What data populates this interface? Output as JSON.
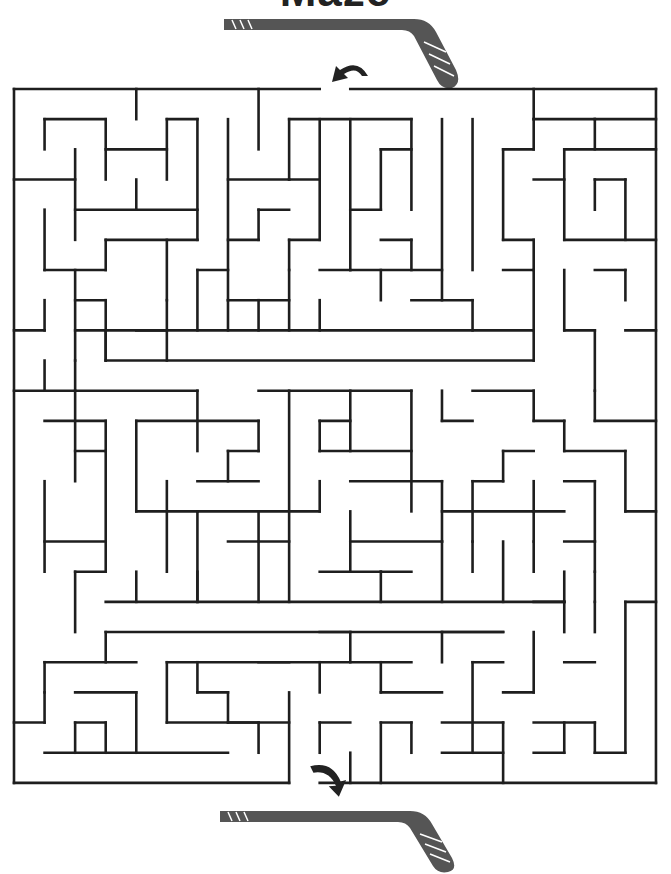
{
  "title": "Maze",
  "colors": {
    "wall": "#1e1e1e",
    "stick": "#555555",
    "arrow": "#222222",
    "background": "#ffffff"
  },
  "maze": {
    "origin": [
      14,
      89
    ],
    "cell": [
      30.57,
      30.17
    ],
    "cols": 21,
    "rows": 23,
    "entrance": {
      "label": "start-arrow",
      "col": 10.5,
      "side": "top"
    },
    "exit": {
      "label": "finish-arrow",
      "col": 10.5,
      "side": "bottom"
    },
    "walls": [
      [
        0,
        0,
        10,
        0
      ],
      [
        11,
        0,
        21,
        0
      ],
      [
        0,
        0,
        0,
        23
      ],
      [
        21,
        0,
        21,
        23
      ],
      [
        0,
        23,
        9,
        23
      ],
      [
        10,
        23,
        21,
        23
      ],
      [
        4,
        0,
        4,
        1
      ],
      [
        8,
        0,
        8,
        2
      ],
      [
        17,
        0,
        17,
        1
      ],
      [
        1,
        1,
        3,
        1
      ],
      [
        1,
        1,
        1,
        2
      ],
      [
        3,
        1,
        3,
        3
      ],
      [
        3,
        2,
        5,
        2
      ],
      [
        5,
        1,
        5,
        3
      ],
      [
        5,
        1,
        6,
        1
      ],
      [
        6,
        1,
        6,
        5
      ],
      [
        7,
        1,
        7,
        7
      ],
      [
        9,
        1,
        13,
        1
      ],
      [
        9,
        1,
        9,
        3
      ],
      [
        10,
        1,
        10,
        5
      ],
      [
        11,
        1,
        11,
        6
      ],
      [
        17,
        1,
        19,
        1
      ],
      [
        19,
        1,
        21,
        1
      ],
      [
        19,
        1,
        19,
        2
      ],
      [
        0,
        3,
        2,
        3
      ],
      [
        2,
        2,
        2,
        5
      ],
      [
        2,
        4,
        6,
        4
      ],
      [
        4,
        3,
        4,
        4
      ],
      [
        7,
        3,
        9,
        3
      ],
      [
        9,
        3,
        10,
        3
      ],
      [
        13,
        1,
        13,
        4
      ],
      [
        16,
        2,
        17,
        2
      ],
      [
        17,
        2,
        17,
        1
      ],
      [
        18,
        2,
        18,
        5
      ],
      [
        18,
        2,
        21,
        2
      ],
      [
        12,
        2,
        13,
        2
      ],
      [
        12,
        2,
        12,
        4
      ],
      [
        16,
        2,
        16,
        5
      ],
      [
        14,
        1,
        14,
        7
      ],
      [
        15,
        1,
        15,
        6
      ],
      [
        1,
        4,
        1,
        6
      ],
      [
        1,
        6,
        3,
        6
      ],
      [
        3,
        5,
        3,
        6
      ],
      [
        3,
        5,
        6,
        5
      ],
      [
        5,
        5,
        5,
        7
      ],
      [
        6,
        6,
        7,
        6
      ],
      [
        8,
        4,
        9,
        4
      ],
      [
        8,
        4,
        8,
        5
      ],
      [
        7,
        5,
        8,
        5
      ],
      [
        9,
        5,
        9,
        6
      ],
      [
        9,
        5,
        10,
        5
      ],
      [
        11,
        4,
        12,
        4
      ],
      [
        12,
        5,
        13,
        5
      ],
      [
        13,
        5,
        13,
        6
      ],
      [
        10,
        6,
        11,
        6
      ],
      [
        17,
        3,
        18,
        3
      ],
      [
        16,
        5,
        17,
        5
      ],
      [
        17,
        5,
        17,
        6
      ],
      [
        18,
        5,
        21,
        5
      ],
      [
        19,
        3,
        20,
        3
      ],
      [
        19,
        3,
        19,
        4
      ],
      [
        20,
        3,
        20,
        5
      ],
      [
        2,
        6,
        2,
        9
      ],
      [
        2,
        7,
        3,
        7
      ],
      [
        0,
        8,
        1,
        8
      ],
      [
        1,
        7,
        1,
        8
      ],
      [
        3,
        7,
        3,
        9
      ],
      [
        4,
        8,
        5,
        8
      ],
      [
        5,
        7,
        5,
        9
      ],
      [
        6,
        6,
        6,
        8
      ],
      [
        7,
        7,
        7,
        8
      ],
      [
        7,
        7,
        9,
        7
      ],
      [
        8,
        7,
        8,
        8
      ],
      [
        9,
        6,
        9,
        8
      ],
      [
        10,
        7,
        10,
        8
      ],
      [
        11,
        6,
        14,
        6
      ],
      [
        12,
        6,
        12,
        7
      ],
      [
        13,
        7,
        15,
        7
      ],
      [
        15,
        7,
        15,
        8
      ],
      [
        16,
        6,
        17,
        6
      ],
      [
        17,
        6,
        17,
        8
      ],
      [
        18,
        6,
        18,
        8
      ],
      [
        19,
        6,
        20,
        6
      ],
      [
        20,
        6,
        20,
        7
      ],
      [
        2,
        8,
        3,
        8
      ],
      [
        3,
        8,
        3,
        9
      ],
      [
        3,
        9,
        17,
        9
      ],
      [
        3,
        8,
        17,
        8
      ],
      [
        17,
        8,
        17,
        9
      ],
      [
        18,
        8,
        19,
        8
      ],
      [
        19,
        8,
        19,
        10
      ],
      [
        20,
        8,
        21,
        8
      ],
      [
        0,
        10,
        2,
        10
      ],
      [
        1,
        9,
        1,
        10
      ],
      [
        2,
        10,
        6,
        10
      ],
      [
        2,
        9,
        2,
        13
      ],
      [
        6,
        10,
        6,
        12
      ],
      [
        8,
        10,
        13,
        10
      ],
      [
        9,
        10,
        9,
        17
      ],
      [
        10,
        11,
        11,
        11
      ],
      [
        10,
        11,
        10,
        12
      ],
      [
        11,
        10,
        11,
        12
      ],
      [
        13,
        10,
        13,
        14
      ],
      [
        14,
        10,
        14,
        11
      ],
      [
        14,
        11,
        15,
        11
      ],
      [
        15,
        10,
        17,
        10
      ],
      [
        17,
        10,
        17,
        11
      ],
      [
        16,
        12,
        17,
        12
      ],
      [
        17,
        11,
        18,
        11
      ],
      [
        18,
        11,
        18,
        12
      ],
      [
        19,
        10,
        19,
        11
      ],
      [
        19,
        11,
        21,
        11
      ],
      [
        18,
        12,
        20,
        12
      ],
      [
        20,
        12,
        20,
        14
      ],
      [
        1,
        11,
        3,
        11
      ],
      [
        3,
        11,
        3,
        12
      ],
      [
        2,
        12,
        3,
        12
      ],
      [
        3,
        12,
        3,
        16
      ],
      [
        4,
        11,
        4,
        14
      ],
      [
        4,
        11,
        8,
        11
      ],
      [
        8,
        11,
        8,
        12
      ],
      [
        7,
        12,
        8,
        12
      ],
      [
        7,
        12,
        7,
        13
      ],
      [
        6,
        13,
        8,
        13
      ],
      [
        1,
        13,
        1,
        16
      ],
      [
        1,
        15,
        3,
        15
      ],
      [
        4,
        14,
        6,
        14
      ],
      [
        5,
        13,
        5,
        16
      ],
      [
        10,
        12,
        13,
        12
      ],
      [
        10,
        13,
        10,
        14
      ],
      [
        11,
        13,
        14,
        13
      ],
      [
        14,
        13,
        14,
        15
      ],
      [
        14,
        14,
        17,
        14
      ],
      [
        16,
        12,
        16,
        13
      ],
      [
        15,
        13,
        16,
        13
      ],
      [
        15,
        13,
        15,
        15
      ],
      [
        17,
        13,
        17,
        15
      ],
      [
        17,
        14,
        18,
        14
      ],
      [
        18,
        13,
        19,
        13
      ],
      [
        19,
        13,
        19,
        15
      ],
      [
        20,
        14,
        21,
        14
      ],
      [
        6,
        14,
        10,
        14
      ],
      [
        6,
        14,
        6,
        17
      ],
      [
        8,
        14,
        8,
        15
      ],
      [
        7,
        15,
        9,
        15
      ],
      [
        8,
        15,
        8,
        17
      ],
      [
        11,
        15,
        14,
        15
      ],
      [
        11,
        14,
        11,
        16
      ],
      [
        12,
        16,
        13,
        16
      ],
      [
        14,
        15,
        14,
        17
      ],
      [
        15,
        15,
        15,
        16
      ],
      [
        16,
        15,
        16,
        17
      ],
      [
        17,
        15,
        17,
        16
      ],
      [
        18,
        15,
        19,
        15
      ],
      [
        19,
        16,
        19,
        17
      ],
      [
        19,
        15,
        19,
        16
      ],
      [
        2,
        16,
        3,
        16
      ],
      [
        2,
        16,
        2,
        18
      ],
      [
        3,
        17,
        18,
        17
      ],
      [
        3,
        18,
        16,
        18
      ],
      [
        3,
        18,
        3,
        19
      ],
      [
        4,
        17,
        4,
        16
      ],
      [
        6,
        17,
        6,
        16
      ],
      [
        10,
        16,
        12,
        16
      ],
      [
        12,
        16,
        12,
        17
      ],
      [
        17,
        17,
        18,
        17
      ],
      [
        18,
        17,
        18,
        16
      ],
      [
        19,
        17,
        19,
        18
      ],
      [
        18,
        17,
        18,
        18
      ],
      [
        20,
        17,
        21,
        17
      ],
      [
        20,
        17,
        20,
        22
      ],
      [
        1,
        19,
        4,
        19
      ],
      [
        1,
        19,
        1,
        20
      ],
      [
        2,
        20,
        4,
        20
      ],
      [
        4,
        20,
        4,
        22
      ],
      [
        5,
        19,
        5,
        21
      ],
      [
        5,
        19,
        13,
        19
      ],
      [
        6,
        19,
        6,
        20
      ],
      [
        6,
        20,
        7,
        20
      ],
      [
        7,
        20,
        7,
        21
      ],
      [
        7,
        21,
        9,
        21
      ],
      [
        9,
        20,
        9,
        23
      ],
      [
        8,
        19,
        9,
        19
      ],
      [
        10,
        19,
        10,
        20
      ],
      [
        10,
        18,
        11,
        18
      ],
      [
        11,
        18,
        11,
        19
      ],
      [
        12,
        19,
        12,
        20
      ],
      [
        12,
        20,
        14,
        20
      ],
      [
        14,
        18,
        16,
        18
      ],
      [
        14,
        18,
        14,
        19
      ],
      [
        14,
        21,
        16,
        21
      ],
      [
        15,
        19,
        15,
        22
      ],
      [
        15,
        19,
        16,
        19
      ],
      [
        16,
        20,
        17,
        20
      ],
      [
        17,
        18,
        17,
        20
      ],
      [
        18,
        19,
        19,
        19
      ],
      [
        17,
        21,
        19,
        21
      ],
      [
        16,
        21,
        16,
        23
      ],
      [
        19,
        22,
        20,
        22
      ],
      [
        19,
        21,
        19,
        22
      ],
      [
        0,
        21,
        1,
        21
      ],
      [
        1,
        20,
        1,
        21
      ],
      [
        2,
        21,
        3,
        21
      ],
      [
        3,
        21,
        3,
        22
      ],
      [
        1,
        22,
        7,
        22
      ],
      [
        2,
        22,
        2,
        21
      ],
      [
        5,
        21,
        8,
        21
      ],
      [
        8,
        21,
        8,
        22
      ],
      [
        10,
        21,
        11,
        21
      ],
      [
        10,
        21,
        10,
        22
      ],
      [
        12,
        21,
        13,
        21
      ],
      [
        12,
        21,
        12,
        23
      ],
      [
        13,
        21,
        13,
        22
      ],
      [
        14,
        22,
        16,
        22
      ],
      [
        11,
        22,
        11,
        23
      ],
      [
        17,
        22,
        18,
        22
      ],
      [
        18,
        21,
        18,
        22
      ]
    ]
  },
  "hockey_sticks": [
    {
      "position": "top",
      "tape_marks": "N/N",
      "x": 224,
      "y": 14
    },
    {
      "position": "bottom",
      "tape_marks": "N/N",
      "x": 220,
      "y": 808
    }
  ]
}
